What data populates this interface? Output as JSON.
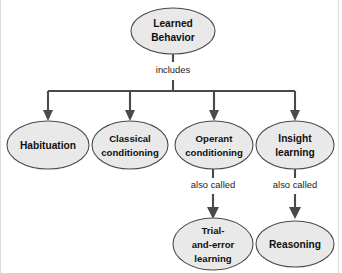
{
  "diagram": {
    "background_color": "#ffffff",
    "node_fill_color": "#e9e9e9",
    "node_stroke_color": "#4a4a4a",
    "connector_color": "#4a4a4a",
    "text_color": "#101010",
    "root": {
      "id": "learned-behavior",
      "line1": "Learned",
      "line2": "Behavior",
      "cx": 173,
      "cy": 31,
      "rx": 42,
      "ry": 23
    },
    "edge_labels": {
      "includes": "includes",
      "also_called_left": "also called",
      "also_called_right": "also called"
    },
    "level2": [
      {
        "id": "habituation",
        "line1": "Habituation",
        "line2": "",
        "cx": 48,
        "cy": 145,
        "rx": 41,
        "ry": 24
      },
      {
        "id": "classical-conditioning",
        "line1": "Classical",
        "line2": "conditioning",
        "cx": 130,
        "cy": 145,
        "rx": 38,
        "ry": 24
      },
      {
        "id": "operant-conditioning",
        "line1": "Operant",
        "line2": "conditioning",
        "cx": 214,
        "cy": 145,
        "rx": 39,
        "ry": 24
      },
      {
        "id": "insight-learning",
        "line1": "Insight",
        "line2": "learning",
        "cx": 295,
        "cy": 145,
        "rx": 39,
        "ry": 24
      }
    ],
    "level3": [
      {
        "id": "trial-and-error-learning",
        "line1": "Trial-",
        "line2": "and-error",
        "line3": "learning",
        "cx": 213,
        "cy": 244,
        "rx": 40,
        "ry": 26
      },
      {
        "id": "reasoning",
        "line1": "Reasoning",
        "line2": "",
        "cx": 295,
        "cy": 244,
        "rx": 39,
        "ry": 23
      }
    ]
  }
}
